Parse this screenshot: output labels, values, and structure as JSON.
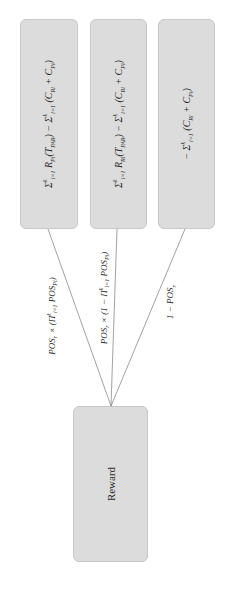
{
  "diagram": {
    "type": "decision-tree",
    "orientation": "rotated-90-ccw",
    "root": {
      "label": "Reward"
    },
    "outcomes": [
      {
        "id": "outcome-1",
        "formula_text": "Σ_{i=1}^{k} R_{Pi}(T_{PAR}) − Σ_{i=1}^{k} (C_{Ri} + C_{Pi})",
        "parts": {
          "sum1": "Σ",
          "sum1_sup": "k",
          "sum1_sub": "i=1",
          "term": "R",
          "term_sub": "Pi",
          "arg": "(T",
          "arg_sub": "PAR",
          "arg_close": ")",
          "minus": " − ",
          "sum2": "Σ",
          "sum2_sup": "k",
          "sum2_sub": "i=1",
          "cost_open": " (C",
          "cost1_sub": "Ri",
          "plus": " + C",
          "cost2_sub": "Pi",
          "cost_close": ")"
        },
        "edge_label_text": "POS_r × (Π_{i=1}^{k} POS_{Pi})",
        "edge_parts": {
          "a": "POS",
          "a_sub": "r",
          "b": " × (Π",
          "b_sup": "k",
          "b_sub": "i=1",
          "c": " POS",
          "c_sub": "Pi",
          "d": ")"
        }
      },
      {
        "id": "outcome-2",
        "formula_text": "Σ_{i=1}^{k} R_{Ri}(T_{PAR}) − Σ_{i=1}^{k} (C_{Ri} + C_{Pi})",
        "parts": {
          "sum1": "Σ",
          "sum1_sup": "k",
          "sum1_sub": "i=1",
          "term": "R",
          "term_sub": "Ri",
          "arg": "(T",
          "arg_sub": "PAR",
          "arg_close": ")",
          "minus": " − ",
          "sum2": "Σ",
          "sum2_sup": "k",
          "sum2_sub": "i=1",
          "cost_open": " (C",
          "cost1_sub": "Ri",
          "plus": " + C",
          "cost2_sub": "Pi",
          "cost_close": ")"
        },
        "edge_label_text": "POS_r × (1 − Π_{i=1}^{k} POS_{Pi})",
        "edge_parts": {
          "a": "POS",
          "a_sub": "r",
          "b": " × (1 − Π",
          "b_sup": "k",
          "b_sub": "i=1",
          "c": " POS",
          "c_sub": "Pi",
          "d": ")"
        }
      },
      {
        "id": "outcome-3",
        "formula_text": "− Σ_{i=1}^{k} (C_{Ri} + C_{Pi})",
        "parts": {
          "minus": "− ",
          "sum2": "Σ",
          "sum2_sup": "k",
          "sum2_sub": "i=1",
          "cost_open": " (C",
          "cost1_sub": "Ri",
          "plus": " + C",
          "cost2_sub": "Pi",
          "cost_close": ")"
        },
        "edge_label_text": "1 − POS_r",
        "edge_parts": {
          "a": "1 − POS",
          "a_sub": "r"
        }
      }
    ],
    "colors": {
      "node_fill": "#dcdcdc",
      "node_border": "#c8c8c8",
      "edge": "#8a8a8a",
      "text": "#2a2a2a"
    }
  }
}
